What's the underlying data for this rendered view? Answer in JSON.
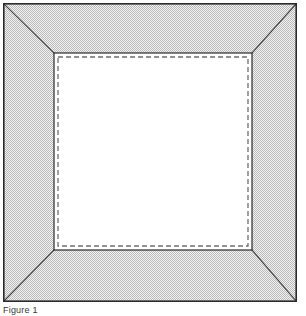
{
  "figure": {
    "caption": "Figure 1",
    "title": "",
    "kind": "line-drawing",
    "colors": {
      "page_background": "#ffffff",
      "frame_line": "#2a2a2c",
      "miter_line": "#3a3a3c",
      "tone_fill_dark": "#b9b9b9",
      "tone_fill_light": "#f3f3f3",
      "tone_average": "#d6d6d6",
      "opening_fill": "#ffffff",
      "dashed_line": "#6f6f72",
      "caption_text": "#38383a"
    },
    "geometry": {
      "outer_rect": {
        "x": 3,
        "y": 3,
        "width": 294,
        "height": 299
      },
      "inner_rect": {
        "x": 54,
        "y": 53,
        "width": 198,
        "height": 197
      },
      "dash_rect": {
        "x": 58,
        "y": 57,
        "width": 190,
        "height": 189
      },
      "outer_stroke_width": 1.6,
      "inner_stroke_width": 1.2,
      "miter_stroke_width": 1.1,
      "dash_stroke_width": 1.3,
      "dash_pattern": "5 3"
    },
    "parts": [
      {
        "name": "outer-edge",
        "label": "Outer frame edge"
      },
      {
        "name": "border-band",
        "label": "Frame moulding face (screen tone)"
      },
      {
        "name": "miter-top-left",
        "label": "Top-left mitre joint"
      },
      {
        "name": "miter-top-right",
        "label": "Top-right mitre joint"
      },
      {
        "name": "miter-bottom-left",
        "label": "Bottom-left mitre joint"
      },
      {
        "name": "miter-bottom-right",
        "label": "Bottom-right mitre joint"
      },
      {
        "name": "sight-edge",
        "label": "Inner sight edge of opening"
      },
      {
        "name": "rebate-line",
        "label": "Dashed rebate / glass line"
      },
      {
        "name": "opening",
        "label": "Frame opening (blank)"
      }
    ]
  }
}
